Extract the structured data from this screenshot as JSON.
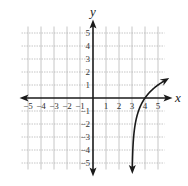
{
  "chart_data": {
    "type": "line",
    "title": "",
    "xlabel": "x",
    "ylabel": "y",
    "xlim": [
      -5.5,
      5.5
    ],
    "ylim": [
      -5.5,
      5.5
    ],
    "grid": true,
    "x_ticks": [
      -5,
      -4,
      -3,
      -2,
      -1,
      1,
      2,
      3,
      4,
      5
    ],
    "y_ticks": [
      -5,
      -4,
      -3,
      -2,
      -1,
      1,
      2,
      3,
      4,
      5
    ],
    "x_tick_labels": [
      "−5",
      "−4",
      "−3",
      "−2",
      "−1",
      "1",
      "2",
      "3",
      "4",
      "5"
    ],
    "y_tick_labels": [
      "−5",
      "−4",
      "−3",
      "−2",
      "−1",
      "1",
      "2",
      "3",
      "4",
      "5"
    ],
    "series": [
      {
        "name": "curve",
        "description": "logarithmic curve with vertical asymptote at x = 3, passing through (4, 0)",
        "equation": "y = log2(x - 3)",
        "points": [
          {
            "x": 3.03,
            "y": -5.0
          },
          {
            "x": 3.06,
            "y": -4.0
          },
          {
            "x": 3.125,
            "y": -3.0
          },
          {
            "x": 3.25,
            "y": -2.0
          },
          {
            "x": 3.5,
            "y": -1.0
          },
          {
            "x": 4.0,
            "y": 0.0
          },
          {
            "x": 5.0,
            "y": 1.0
          },
          {
            "x": 5.5,
            "y": 1.32
          }
        ],
        "asymptote_x": 3,
        "color": "#1a1a1a"
      }
    ]
  },
  "axes": {
    "x_label": "x",
    "y_label": "y"
  },
  "colors": {
    "axis": "#1a1a1a",
    "grid": "#b8b8b8",
    "curve": "#1a1a1a"
  }
}
